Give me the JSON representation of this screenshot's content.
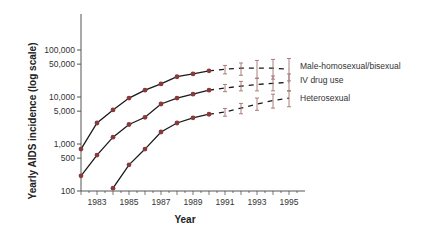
{
  "chart_data": {
    "type": "line",
    "title": "",
    "xlabel": "Year",
    "ylabel": "Yearly AIDS incidence (log scale)",
    "yscale": "log",
    "ylim": [
      100,
      200000
    ],
    "xlim": [
      1982,
      1995
    ],
    "x_tick_labels": [
      "1983",
      "1985",
      "1987",
      "1989",
      "1991",
      "1993",
      "1995"
    ],
    "y_tick_labels": [
      {
        "value": 100,
        "label": "100"
      },
      {
        "value": 500,
        "label": "500"
      },
      {
        "value": 1000,
        "label": "1,000"
      },
      {
        "value": 5000,
        "label": "5,000"
      },
      {
        "value": 10000,
        "label": "10,000"
      },
      {
        "value": 50000,
        "label": "50,000"
      },
      {
        "value": 100000,
        "label": "100,000"
      }
    ],
    "grid": false,
    "legend_position": "inline-right",
    "series": [
      {
        "name": "Male-homosexual/bisexual",
        "observed": {
          "x": [
            1982,
            1983,
            1984,
            1985,
            1986,
            1987,
            1988,
            1989,
            1990
          ],
          "y": [
            780,
            2800,
            5300,
            9500,
            14000,
            19000,
            27000,
            31000,
            36000
          ]
        },
        "projected": {
          "x": [
            1991,
            1992,
            1993,
            1994,
            1995
          ],
          "y": [
            39000,
            41000,
            41000,
            41000,
            39000
          ],
          "err_low": [
            31000,
            29000,
            25000,
            24000,
            22000
          ],
          "err_high": [
            47000,
            53000,
            60000,
            63000,
            66000
          ]
        }
      },
      {
        "name": "IV drug use",
        "observed": {
          "x": [
            1982,
            1983,
            1984,
            1985,
            1986,
            1987,
            1988,
            1989,
            1990
          ],
          "y": [
            210,
            580,
            1400,
            2600,
            3700,
            7100,
            9500,
            11500,
            14000
          ]
        },
        "projected": {
          "x": [
            1991,
            1992,
            1993,
            1994,
            1995
          ],
          "y": [
            15500,
            17000,
            18500,
            19500,
            20500
          ],
          "err_low": [
            13000,
            13500,
            13500,
            13500,
            13500
          ],
          "err_high": [
            18500,
            21500,
            25000,
            28000,
            31000
          ]
        }
      },
      {
        "name": "Heterosexual",
        "observed": {
          "x": [
            1984,
            1985,
            1986,
            1987,
            1988,
            1989,
            1990
          ],
          "y": [
            115,
            360,
            780,
            1800,
            2800,
            3600,
            4300
          ]
        },
        "projected": {
          "x": [
            1991,
            1992,
            1993,
            1994,
            1995
          ],
          "y": [
            4800,
            5800,
            7100,
            8400,
            9500
          ],
          "err_low": [
            3900,
            4400,
            5200,
            5800,
            6200
          ],
          "err_high": [
            5700,
            7300,
            9500,
            11500,
            13500
          ]
        }
      }
    ]
  },
  "labels": {
    "xlabel": "Year",
    "ylabel": "Yearly AIDS incidence (log scale)",
    "legend": [
      "Male-homosexual/bisexual",
      "IV drug use",
      "Heterosexual"
    ]
  },
  "colors": {
    "marker": "#8b3a3a",
    "line": "#1a1a1a",
    "error_bar": "#a07070",
    "axis": "#555555"
  }
}
